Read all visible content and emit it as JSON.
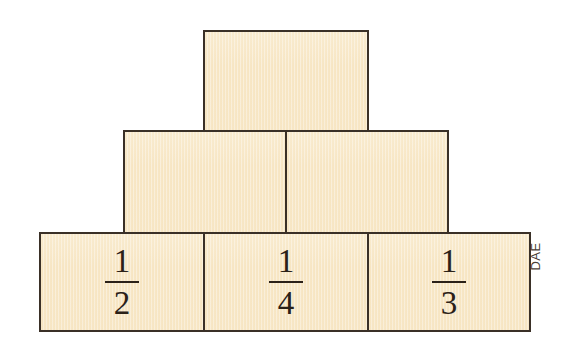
{
  "figure": {
    "background_color": "#ffffff",
    "block_fill_color": "#f7e6c5",
    "block_border_color": "#3a3027",
    "text_color": "#2b2118"
  },
  "credit": {
    "label": "DAE",
    "orientation": "vertical-rotated-90"
  },
  "rows": {
    "top": {
      "blocks": [
        {
          "id": "top-1",
          "label": "",
          "numerator": "",
          "denominator": ""
        }
      ]
    },
    "middle": {
      "blocks": [
        {
          "id": "mid-1",
          "label": "",
          "numerator": "",
          "denominator": ""
        },
        {
          "id": "mid-2",
          "label": "",
          "numerator": "",
          "denominator": ""
        }
      ]
    },
    "bottom": {
      "blocks": [
        {
          "id": "bot-1",
          "label": "1/2",
          "numerator": "1",
          "denominator": "2"
        },
        {
          "id": "bot-2",
          "label": "1/4",
          "numerator": "1",
          "denominator": "4"
        },
        {
          "id": "bot-3",
          "label": "1/3",
          "numerator": "1",
          "denominator": "3"
        }
      ]
    }
  }
}
